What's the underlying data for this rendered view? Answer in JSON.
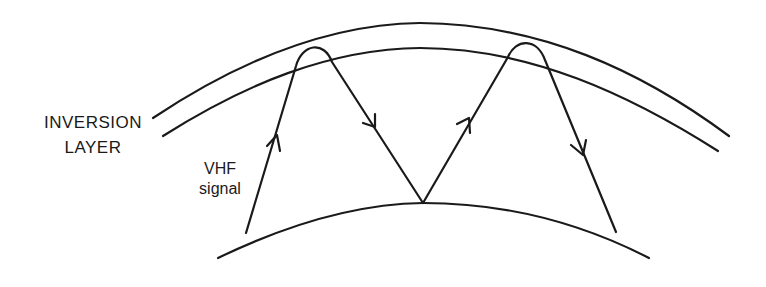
{
  "diagram": {
    "type": "radio-propagation",
    "labels": {
      "inversion_line1": "INVERSION",
      "inversion_line2": "LAYER",
      "signal_line1": "VHF",
      "signal_line2": "signal"
    },
    "colors": {
      "background": "#ffffff",
      "stroke": "#1a1a1a"
    },
    "elements": [
      {
        "name": "inversion-layer-upper-boundary",
        "kind": "arc"
      },
      {
        "name": "inversion-layer-lower-boundary",
        "kind": "arc"
      },
      {
        "name": "earth-surface",
        "kind": "arc"
      },
      {
        "name": "vhf-signal-ray",
        "kind": "path",
        "description": "Signal rises into inversion layer, refracts back down, reflects off earth surface, rises again and refracts down"
      }
    ],
    "arrows": [
      {
        "direction": "up",
        "segment": 1
      },
      {
        "direction": "down",
        "segment": 2
      },
      {
        "direction": "up",
        "segment": 3
      },
      {
        "direction": "down",
        "segment": 4
      }
    ]
  }
}
